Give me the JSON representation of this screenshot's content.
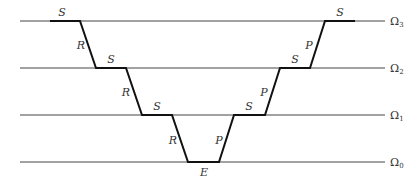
{
  "diagram": {
    "levels": [
      {
        "name": "Ω3",
        "symbol": "Ω",
        "sub": "3",
        "y": 21
      },
      {
        "name": "Ω2",
        "symbol": "Ω",
        "sub": "2",
        "y": 68
      },
      {
        "name": "Ω1",
        "symbol": "Ω",
        "sub": "1",
        "y": 115
      },
      {
        "name": "Ω0",
        "symbol": "Ω",
        "sub": "0",
        "y": 162
      }
    ],
    "segment_labels": {
      "s_top_left": "S",
      "r_3_2": "R",
      "s_2_left": "S",
      "r_2_1": "R",
      "s_1_left": "S",
      "r_1_0": "R",
      "e_bottom": "E",
      "p_0_1": "P",
      "s_1_right": "S",
      "p_1_2": "P",
      "s_2_right": "S",
      "p_2_3": "P",
      "s_top_right": "S"
    },
    "colors": {
      "level_line": "#444444",
      "path": "#111111",
      "text": "#333333"
    }
  }
}
